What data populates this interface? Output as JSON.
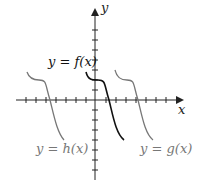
{
  "diagram": {
    "axes": {
      "x_label": "x",
      "y_label": "y"
    },
    "curves": [
      {
        "name": "f",
        "label": "y = f(x)",
        "color": "#111111"
      },
      {
        "name": "g",
        "label": "y = g(x)",
        "color": "#777777"
      },
      {
        "name": "h",
        "label": "y = h(x)",
        "color": "#777777"
      }
    ]
  }
}
